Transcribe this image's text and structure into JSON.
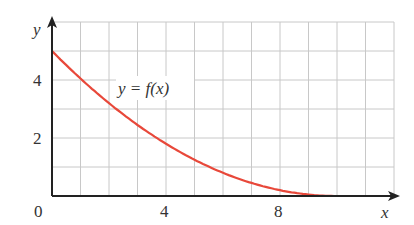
{
  "chart_data": {
    "type": "line",
    "title": "",
    "xlabel": "x",
    "ylabel": "y",
    "xlim": [
      0,
      12
    ],
    "ylim": [
      0,
      6
    ],
    "grid": true,
    "x_ticks": [
      "0",
      "4",
      "8"
    ],
    "y_ticks": [
      "2",
      "4"
    ],
    "series": [
      {
        "name": "y = f(x)",
        "color": "#e8483a",
        "x": [
          0,
          1,
          2,
          3,
          4,
          5,
          6,
          7,
          8,
          9,
          10,
          11
        ],
        "y": [
          5,
          4.05,
          3.2,
          2.45,
          1.8,
          1.25,
          0.8,
          0.45,
          0.2,
          0.05,
          0,
          0
        ]
      }
    ],
    "annotation": "y = f(x)"
  },
  "labels": {
    "y_axis": "y",
    "x_axis": "x",
    "origin": "0",
    "tick4x": "4",
    "tick8x": "8",
    "tick2y": "2",
    "tick4y": "4",
    "curve": "y = f(x)"
  }
}
